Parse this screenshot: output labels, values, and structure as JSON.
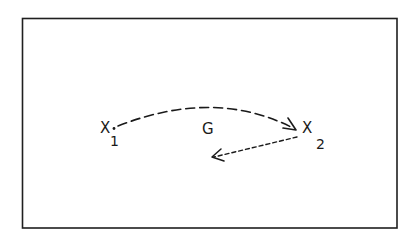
{
  "diagram": {
    "frame": {
      "stroke": "#1f1f1f"
    },
    "nodes": [
      {
        "id": "x1",
        "label": "X",
        "subscript": "1"
      },
      {
        "id": "x2",
        "label": "X",
        "subscript": "2"
      }
    ],
    "edges": [
      {
        "id": "g-arc",
        "from": "x1",
        "to": "x2",
        "style": "long-dash",
        "label": "G"
      },
      {
        "id": "return-arrow",
        "from": "x2",
        "to": "open",
        "style": "short-dash",
        "label": ""
      }
    ],
    "edge_label": "G",
    "ink_color": "#1a1a1a"
  }
}
